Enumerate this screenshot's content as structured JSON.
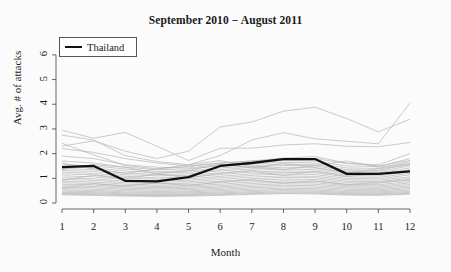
{
  "chart_data": {
    "type": "line",
    "title": "September 2010 − August 2011",
    "xlabel": "Month",
    "ylabel": "Avg. # of attacks",
    "xlim": [
      1,
      12
    ],
    "ylim": [
      0,
      6.4
    ],
    "x": [
      1,
      2,
      3,
      4,
      5,
      6,
      7,
      8,
      9,
      10,
      11,
      12
    ],
    "xticks": [
      "1",
      "2",
      "3",
      "4",
      "5",
      "6",
      "7",
      "8",
      "9",
      "10",
      "11",
      "12"
    ],
    "yticks": [
      "0",
      "1",
      "2",
      "3",
      "4",
      "5",
      "6"
    ],
    "grid": false,
    "legend": {
      "position": "top-left",
      "entries": [
        {
          "name": "Thailand",
          "color": "#111111",
          "width": 2.2
        }
      ]
    },
    "highlight_color": "#111111",
    "background_series_color": "#b4b4b4",
    "series": [
      {
        "name": "Thailand",
        "highlight": true,
        "color": "#111111",
        "values": [
          1.45,
          1.5,
          0.9,
          0.88,
          1.05,
          1.5,
          1.62,
          1.78,
          1.78,
          1.18,
          1.18,
          1.28
        ]
      },
      {
        "name": "country-01",
        "highlight": false,
        "values": [
          2.95,
          2.62,
          2.86,
          2.3,
          1.72,
          2.22,
          2.22,
          2.35,
          2.4,
          2.3,
          2.28,
          2.45
        ]
      },
      {
        "name": "country-02",
        "highlight": false,
        "values": [
          2.3,
          2.52,
          2.1,
          1.8,
          2.1,
          3.08,
          3.28,
          3.72,
          3.88,
          3.42,
          2.88,
          3.4
        ]
      },
      {
        "name": "country-03",
        "highlight": false,
        "values": [
          2.75,
          2.55,
          1.92,
          1.68,
          1.55,
          1.92,
          2.55,
          2.85,
          2.6,
          2.5,
          2.4,
          4.05
        ]
      },
      {
        "name": "country-04",
        "highlight": false,
        "values": [
          2.2,
          2.05,
          1.8,
          1.62,
          1.5,
          1.62,
          1.7,
          1.78,
          1.8,
          1.6,
          1.55,
          2.0
        ]
      },
      {
        "name": "country-05",
        "highlight": false,
        "values": [
          1.9,
          1.8,
          1.55,
          1.45,
          1.42,
          1.55,
          1.65,
          1.72,
          1.7,
          1.5,
          1.48,
          1.8
        ]
      },
      {
        "name": "country-06",
        "highlight": false,
        "values": [
          1.7,
          1.62,
          1.45,
          1.35,
          1.38,
          1.5,
          1.58,
          1.65,
          1.62,
          1.42,
          1.4,
          1.68
        ]
      },
      {
        "name": "country-07",
        "highlight": false,
        "values": [
          1.55,
          1.5,
          1.38,
          1.28,
          1.3,
          1.42,
          1.5,
          1.58,
          1.55,
          1.35,
          1.32,
          1.58
        ]
      },
      {
        "name": "country-08",
        "highlight": false,
        "values": [
          1.48,
          1.42,
          1.3,
          1.22,
          1.25,
          1.35,
          1.45,
          1.52,
          1.5,
          1.3,
          1.28,
          1.5
        ]
      },
      {
        "name": "country-09",
        "highlight": false,
        "values": [
          1.4,
          1.35,
          1.22,
          1.15,
          1.18,
          1.3,
          1.38,
          1.45,
          1.42,
          1.25,
          1.22,
          1.42
        ]
      },
      {
        "name": "country-10",
        "highlight": false,
        "values": [
          1.32,
          1.28,
          1.15,
          1.1,
          1.12,
          1.22,
          1.32,
          1.38,
          1.35,
          1.18,
          1.16,
          1.35
        ]
      },
      {
        "name": "country-11",
        "highlight": false,
        "values": [
          1.25,
          1.2,
          1.08,
          1.02,
          1.05,
          1.15,
          1.25,
          1.3,
          1.28,
          1.12,
          1.1,
          1.28
        ]
      },
      {
        "name": "country-12",
        "highlight": false,
        "values": [
          1.18,
          1.14,
          1.02,
          0.96,
          0.98,
          1.08,
          1.18,
          1.24,
          1.22,
          1.06,
          1.04,
          1.2
        ]
      },
      {
        "name": "country-13",
        "highlight": false,
        "values": [
          1.1,
          1.06,
          0.95,
          0.9,
          0.92,
          1.02,
          1.12,
          1.18,
          1.15,
          1.0,
          0.98,
          1.14
        ]
      },
      {
        "name": "country-14",
        "highlight": false,
        "values": [
          1.02,
          0.98,
          0.88,
          0.84,
          0.86,
          0.95,
          1.05,
          1.1,
          1.08,
          0.94,
          0.92,
          1.06
        ]
      },
      {
        "name": "country-15",
        "highlight": false,
        "values": [
          0.95,
          0.92,
          0.82,
          0.78,
          0.8,
          0.88,
          0.98,
          1.04,
          1.02,
          0.88,
          0.86,
          1.0
        ]
      },
      {
        "name": "country-16",
        "highlight": false,
        "values": [
          0.88,
          0.85,
          0.76,
          0.72,
          0.74,
          0.82,
          0.92,
          0.97,
          0.95,
          0.82,
          0.8,
          0.93
        ]
      },
      {
        "name": "country-17",
        "highlight": false,
        "values": [
          0.82,
          0.79,
          0.7,
          0.67,
          0.69,
          0.76,
          0.85,
          0.9,
          0.88,
          0.76,
          0.74,
          0.87
        ]
      },
      {
        "name": "country-18",
        "highlight": false,
        "values": [
          0.76,
          0.73,
          0.65,
          0.62,
          0.64,
          0.7,
          0.79,
          0.84,
          0.82,
          0.71,
          0.69,
          0.81
        ]
      },
      {
        "name": "country-19",
        "highlight": false,
        "values": [
          0.7,
          0.67,
          0.6,
          0.57,
          0.59,
          0.65,
          0.73,
          0.78,
          0.76,
          0.66,
          0.64,
          0.75
        ]
      },
      {
        "name": "country-20",
        "highlight": false,
        "values": [
          0.64,
          0.62,
          0.55,
          0.52,
          0.54,
          0.6,
          0.67,
          0.72,
          0.7,
          0.61,
          0.59,
          0.69
        ]
      },
      {
        "name": "country-21",
        "highlight": false,
        "values": [
          0.58,
          0.56,
          0.5,
          0.47,
          0.49,
          0.55,
          0.62,
          0.66,
          0.64,
          0.56,
          0.54,
          0.63
        ]
      },
      {
        "name": "country-22",
        "highlight": false,
        "values": [
          0.53,
          0.51,
          0.45,
          0.43,
          0.45,
          0.5,
          0.56,
          0.6,
          0.58,
          0.51,
          0.49,
          0.58
        ]
      },
      {
        "name": "country-23",
        "highlight": false,
        "values": [
          0.48,
          0.46,
          0.41,
          0.39,
          0.41,
          0.45,
          0.51,
          0.55,
          0.53,
          0.46,
          0.45,
          0.52
        ]
      },
      {
        "name": "country-24",
        "highlight": false,
        "values": [
          0.43,
          0.42,
          0.37,
          0.35,
          0.37,
          0.41,
          0.46,
          0.5,
          0.48,
          0.42,
          0.41,
          0.47
        ]
      },
      {
        "name": "country-25",
        "highlight": false,
        "values": [
          0.39,
          0.38,
          0.34,
          0.32,
          0.34,
          0.37,
          0.42,
          0.45,
          0.44,
          0.38,
          0.37,
          0.43
        ]
      },
      {
        "name": "country-26",
        "highlight": false,
        "values": [
          0.36,
          0.34,
          0.31,
          0.29,
          0.31,
          0.34,
          0.38,
          0.41,
          0.4,
          0.35,
          0.34,
          0.39
        ]
      },
      {
        "name": "country-27",
        "highlight": false,
        "values": [
          0.33,
          0.31,
          0.28,
          0.27,
          0.28,
          0.31,
          0.35,
          0.38,
          0.37,
          0.32,
          0.31,
          0.36
        ]
      },
      {
        "name": "country-28",
        "highlight": false,
        "values": [
          1.62,
          1.38,
          1.2,
          1.38,
          1.55,
          1.72,
          1.48,
          1.35,
          1.52,
          1.7,
          1.45,
          1.6
        ]
      },
      {
        "name": "country-29",
        "highlight": false,
        "values": [
          1.35,
          1.55,
          1.45,
          1.18,
          1.32,
          1.58,
          1.42,
          1.6,
          1.44,
          1.22,
          1.38,
          1.55
        ]
      },
      {
        "name": "country-30",
        "highlight": false,
        "values": [
          0.92,
          1.12,
          0.98,
          1.18,
          1.02,
          1.2,
          1.3,
          1.12,
          1.28,
          1.08,
          1.18,
          1.32
        ]
      },
      {
        "name": "country-31",
        "highlight": false,
        "values": [
          0.62,
          0.78,
          0.68,
          0.82,
          0.7,
          0.86,
          0.94,
          0.8,
          0.9,
          0.74,
          0.84,
          0.95
        ]
      },
      {
        "name": "country-32",
        "highlight": false,
        "values": [
          2.42,
          1.95,
          1.52,
          1.38,
          1.48,
          1.62,
          1.7,
          1.82,
          1.88,
          1.62,
          1.5,
          1.72
        ]
      }
    ]
  },
  "axis": {
    "tick_color": "#555555",
    "axis_color": "#555555"
  }
}
